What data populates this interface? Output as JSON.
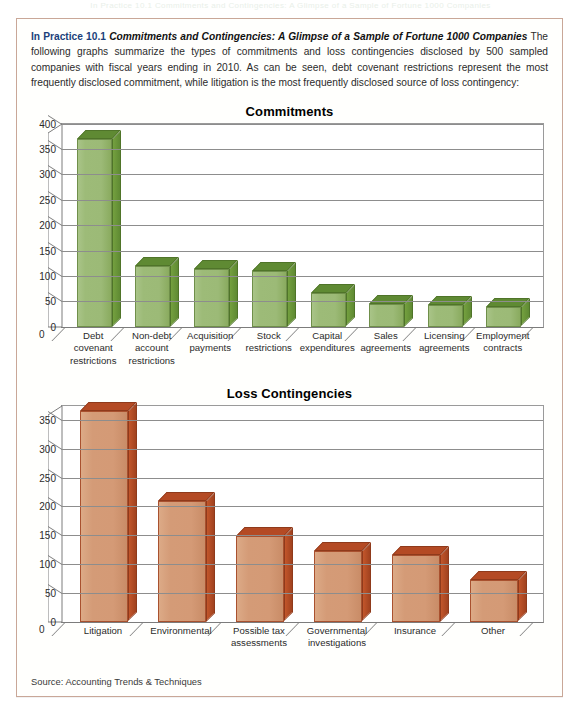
{
  "page_bleed_text": "In Practice 10.1 Commitments and Contingencies: A Glimpse of a Sample of Fortune 1000 Companies",
  "feature": {
    "head_label": "In Practice 10.1",
    "head_title": "Commitments and Contingencies: A Glimpse of a Sample of Fortune 1000 Companies",
    "body_text": "The following graphs summarize the types of commitments and loss contingencies disclosed by 500 sampled companies with fiscal years ending in 2010. As can be seen, debt covenant restrictions represent the most frequently disclosed commitment, while litigation is the most frequently disclosed source of loss contingency:",
    "source": "Source: Accounting Trends & Techniques"
  },
  "colors": {
    "heading_blue": "#1b3f7a",
    "green_face": "#9cba77",
    "green_top": "#5f8a33",
    "green_side": "#6f9a39",
    "clay_face": "#d49a76",
    "clay_top": "#b44a24",
    "clay_side": "#a1421f",
    "box_border": "#c9a798",
    "gridline": "#8d8d8d"
  },
  "chart_data": [
    {
      "id": "commitments",
      "type": "bar",
      "title": "Commitments",
      "xlabel": "",
      "ylabel": "",
      "ylim": [
        0,
        400
      ],
      "yticks": [
        0,
        50,
        100,
        150,
        200,
        250,
        300,
        350,
        400
      ],
      "grid": true,
      "legend": "none",
      "series_color": "#9cba77",
      "categories": [
        "Debt covenant restrictions",
        "Non-debt account restrictions",
        "Acquisition payments",
        "Stock restrictions",
        "Capital expenditures",
        "Sales agreements",
        "Licensing agreements",
        "Employment contracts"
      ],
      "category_lines": [
        [
          "Debt",
          "covenant",
          "restrictions"
        ],
        [
          "Non-debt",
          "account",
          "restrictions"
        ],
        [
          "Acquisition",
          "payments"
        ],
        [
          "Stock",
          "restrictions"
        ],
        [
          "Capital",
          "expenditures"
        ],
        [
          "Sales",
          "agreements"
        ],
        [
          "Licensing",
          "agreements"
        ],
        [
          "Employment",
          "contracts"
        ]
      ],
      "values": [
        370,
        120,
        114,
        110,
        66,
        45,
        42,
        38
      ]
    },
    {
      "id": "loss-contingencies",
      "type": "bar",
      "title": "Loss Contingencies",
      "xlabel": "",
      "ylabel": "",
      "ylim": [
        0,
        375
      ],
      "yticks": [
        0,
        50,
        100,
        150,
        200,
        250,
        300,
        350
      ],
      "grid": true,
      "legend": "none",
      "series_color": "#d49a76",
      "categories": [
        "Litigation",
        "Environmental",
        "Possible tax assessments",
        "Governmental investigations",
        "Insurance",
        "Other"
      ],
      "category_lines": [
        [
          "Litigation"
        ],
        [
          "Environmental"
        ],
        [
          "Possible tax",
          "assessments"
        ],
        [
          "Governmental",
          "investigations"
        ],
        [
          "Insurance"
        ],
        [
          "Other"
        ]
      ],
      "values": [
        365,
        210,
        148,
        122,
        116,
        72
      ]
    }
  ]
}
